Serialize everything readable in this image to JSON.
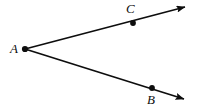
{
  "figure": {
    "type": "geometry-diagram",
    "background_color": "#ffffff",
    "stroke_color": "#0d0d0d",
    "labels": {
      "vertex": "A",
      "upper_ray_point": "C",
      "lower_ray_point": "B"
    },
    "points": [
      {
        "name": "A",
        "role": "vertex",
        "x": 25,
        "y": 49
      },
      {
        "name": "C",
        "role": "point-on-upper-ray",
        "x": 133,
        "y": 23
      },
      {
        "name": "B",
        "role": "point-on-lower-ray",
        "x": 152,
        "y": 88
      }
    ],
    "rays": [
      {
        "name": "ray-AC",
        "from": "A",
        "through": "C",
        "arrow_end": {
          "x": 189,
          "y": 5
        }
      },
      {
        "name": "ray-AB",
        "from": "A",
        "through": "B",
        "arrow_end": {
          "x": 189,
          "y": 101
        }
      }
    ]
  }
}
